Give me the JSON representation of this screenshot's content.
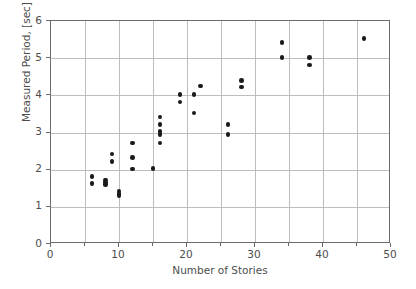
{
  "chart_data": {
    "type": "scatter",
    "title": "",
    "xlabel": "Number of Stories",
    "ylabel": "Measured Period, [sec]",
    "xlim": [
      0,
      50
    ],
    "ylim": [
      0,
      6
    ],
    "xticks": [
      0,
      10,
      20,
      30,
      40,
      50
    ],
    "xtick_labels": [
      "0",
      "10",
      "20",
      "30",
      "40",
      "50"
    ],
    "xminor_ticks": [
      5,
      15,
      25,
      35,
      45
    ],
    "yticks": [
      0,
      1,
      2,
      3,
      4,
      5,
      6
    ],
    "ytick_labels": [
      "0",
      "1",
      "2",
      "3",
      "4",
      "5",
      "6"
    ],
    "grid": true,
    "grid_color": "#bdbdbd",
    "marker_color": "#1a1a1a",
    "marker": "circle",
    "legend": null,
    "points": [
      {
        "x": 6,
        "y": 1.82
      },
      {
        "x": 6,
        "y": 1.62
      },
      {
        "x": 8,
        "y": 1.72
      },
      {
        "x": 8,
        "y": 1.66
      },
      {
        "x": 8,
        "y": 1.6
      },
      {
        "x": 9,
        "y": 2.42
      },
      {
        "x": 9,
        "y": 2.22
      },
      {
        "x": 10,
        "y": 1.43
      },
      {
        "x": 10,
        "y": 1.36
      },
      {
        "x": 10,
        "y": 1.3
      },
      {
        "x": 12,
        "y": 2.72
      },
      {
        "x": 12,
        "y": 2.32
      },
      {
        "x": 12,
        "y": 2.02
      },
      {
        "x": 15,
        "y": 2.03
      },
      {
        "x": 16,
        "y": 3.42
      },
      {
        "x": 16,
        "y": 3.22
      },
      {
        "x": 16,
        "y": 3.02
      },
      {
        "x": 16,
        "y": 2.94
      },
      {
        "x": 16,
        "y": 2.72
      },
      {
        "x": 19,
        "y": 4.02
      },
      {
        "x": 19,
        "y": 3.82
      },
      {
        "x": 21,
        "y": 4.02
      },
      {
        "x": 21,
        "y": 3.53
      },
      {
        "x": 22,
        "y": 4.25
      },
      {
        "x": 26,
        "y": 3.22
      },
      {
        "x": 26,
        "y": 2.94
      },
      {
        "x": 28,
        "y": 4.4
      },
      {
        "x": 28,
        "y": 4.22
      },
      {
        "x": 34,
        "y": 5.42
      },
      {
        "x": 34,
        "y": 5.01
      },
      {
        "x": 38,
        "y": 5.02
      },
      {
        "x": 38,
        "y": 4.82
      },
      {
        "x": 46,
        "y": 5.53
      }
    ]
  }
}
